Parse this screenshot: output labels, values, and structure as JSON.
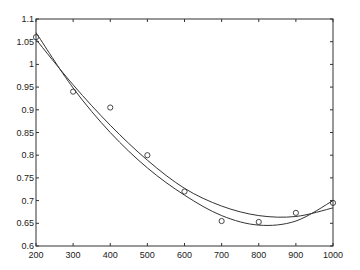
{
  "chart_data": {
    "type": "scatter",
    "title": "",
    "xlabel": "",
    "ylabel": "",
    "xlim": [
      200,
      1000
    ],
    "ylim": [
      0.6,
      1.1
    ],
    "xticks": [
      200,
      300,
      400,
      500,
      600,
      700,
      800,
      900,
      1000
    ],
    "yticks": [
      0.6,
      0.65,
      0.7,
      0.75,
      0.8,
      0.85,
      0.9,
      0.95,
      1,
      1.05,
      1.1
    ],
    "ytick_labels": [
      "0.6",
      "0.65",
      "0.7",
      "0.75",
      "0.8",
      "0.85",
      "0.9",
      "0.95",
      "1",
      "1.05",
      "1.1"
    ],
    "xtick_labels": [
      "200",
      "300",
      "400",
      "500",
      "600",
      "700",
      "800",
      "900",
      "1000"
    ],
    "grid": false,
    "legend": null,
    "series": [
      {
        "name": "data",
        "style": "markers-circle",
        "x": [
          200,
          300,
          400,
          500,
          600,
          700,
          800,
          900,
          1000
        ],
        "y": [
          1.06,
          0.94,
          0.905,
          0.8,
          0.72,
          0.655,
          0.653,
          0.673,
          0.695
        ]
      },
      {
        "name": "fit-quadratic",
        "style": "line",
        "x": [
          200,
          300,
          400,
          500,
          600,
          700,
          800,
          900,
          1000
        ],
        "y": [
          1.055,
          0.955,
          0.866,
          0.789,
          0.727,
          0.688,
          0.667,
          0.665,
          0.684
        ]
      },
      {
        "name": "fit-cubic",
        "style": "line",
        "x": [
          200,
          300,
          400,
          500,
          600,
          700,
          800,
          900,
          1000
        ],
        "y": [
          1.07,
          0.948,
          0.85,
          0.772,
          0.712,
          0.667,
          0.646,
          0.655,
          0.7
        ]
      }
    ],
    "colors": {
      "axis": "#333333",
      "line": "#333333",
      "marker": "#333333",
      "background": "#ffffff"
    }
  }
}
